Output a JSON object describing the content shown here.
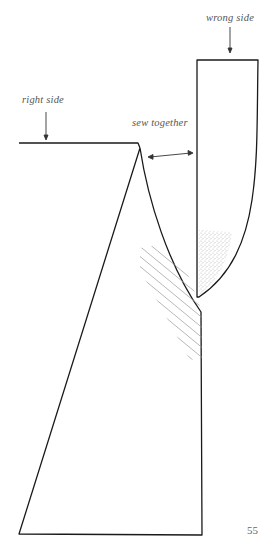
{
  "diagram": {
    "labels": {
      "wrong_side": "wrong side",
      "right_side": "right side",
      "sew_together": "sew together"
    },
    "pieces": [
      {
        "name": "left-panel",
        "side": "right side"
      },
      {
        "name": "right-panel",
        "side": "wrong side"
      }
    ],
    "annotations": {
      "arrow_type": "double-headed",
      "stipple_region": "wrong-side-curve-tip",
      "hatch_region": "seam-allowance"
    },
    "colors": {
      "stroke": "#1a1a1a",
      "arrow": "#333333",
      "hatch": "#9a9a9a",
      "stipple": "#777777"
    }
  },
  "page": {
    "number": "55"
  }
}
